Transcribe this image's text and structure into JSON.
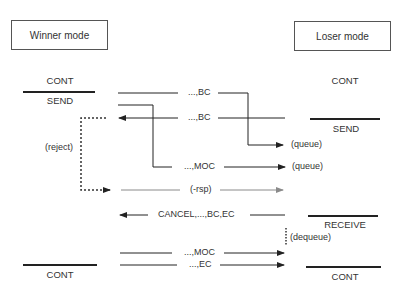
{
  "diagram": {
    "type": "sequence",
    "left_party": {
      "title": "Winner mode",
      "states": [
        {
          "label": "CONT"
        },
        {
          "label": "SEND"
        },
        {
          "label": "CONT"
        }
      ]
    },
    "right_party": {
      "title": "Loser mode",
      "states": [
        {
          "label": "CONT"
        },
        {
          "label": "SEND"
        },
        {
          "label": "RECEIVE"
        },
        {
          "label": "CONT"
        }
      ]
    },
    "messages": [
      {
        "label": "...,BC",
        "direction": "right",
        "note": "(queue)"
      },
      {
        "label": "...,BC",
        "direction": "left"
      },
      {
        "label": "...,MOC",
        "direction": "right",
        "note": "(queue)"
      },
      {
        "label": "(-rsp)",
        "direction": "right",
        "style": "gray"
      },
      {
        "label": "CANCEL,...,BC,EC",
        "direction": "left"
      },
      {
        "label": "...,MOC",
        "direction": "right"
      },
      {
        "label": "...,EC",
        "direction": "right"
      }
    ],
    "annotations": [
      {
        "label": "(reject)"
      },
      {
        "label": "(queue)"
      },
      {
        "label": "(queue)"
      },
      {
        "label": "(dequeue)"
      }
    ],
    "colors": {
      "line": "#222222",
      "gray_arrow": "#8a8a8a"
    }
  }
}
